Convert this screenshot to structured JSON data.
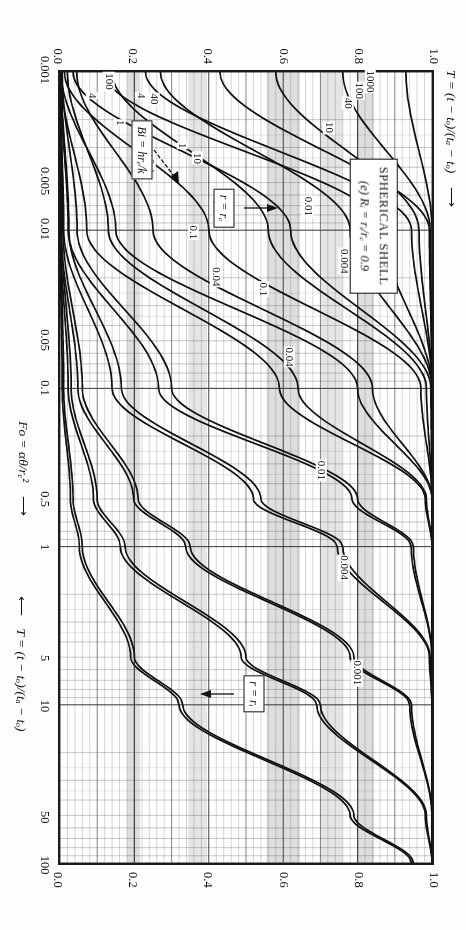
{
  "figure": {
    "title_line1": "SPHERICAL SHELL",
    "title_line2_prefix": "(e) ",
    "title_line2": "Rᵢ = rᵢ/rₑ = 0.9",
    "panel_letter": "(e)"
  },
  "axes": {
    "x_label_plain": "Fo = αθ/rₑ²",
    "x_label_arrow": "⟶",
    "y_label_plain": "T = (t − tₒ)/(tₐ − tₒ)",
    "y_label_arrow_top": "⟶",
    "y_label_arrow_bottom": "⟵",
    "x_ticks": [
      "0.001",
      "0.005",
      "0.01",
      "0.05",
      "0.1",
      "0.5",
      "1",
      "5",
      "10",
      "50",
      "100"
    ],
    "x_tick_values": [
      0.001,
      0.005,
      0.01,
      0.05,
      0.1,
      0.5,
      1,
      5,
      10,
      50,
      100
    ],
    "y_ticks": [
      "0.0",
      "0.2",
      "0.4",
      "0.6",
      "0.8",
      "1.0"
    ],
    "y_tick_values": [
      0.0,
      0.2,
      0.4,
      0.6,
      0.8,
      1.0
    ],
    "x_min": 0.001,
    "x_max": 100,
    "y_min": 0.0,
    "y_max": 1.0,
    "x_scale": "log",
    "y_scale": "linear"
  },
  "annotations": {
    "surface_box": "r = rₑ",
    "inner_box": "r = rᵢ",
    "bi_box": "Bi = hrₑ/k"
  },
  "chart_data": {
    "type": "line",
    "title": "SPHERICAL SHELL  (e) Rᵢ = rᵢ/rₑ = 0.9",
    "xlabel": "Fo = αθ/rₑ²",
    "ylabel": "T = (t − tₒ)/(tₐ − tₒ)",
    "xlim": [
      0.001,
      100
    ],
    "ylim": [
      0.0,
      1.0
    ],
    "xscale": "log",
    "yscale": "linear",
    "grid": true,
    "legend": "none",
    "legend_position": "none",
    "series_groups": [
      {
        "group": "r = rₑ",
        "note": "outer-surface temperature curves; T rises from 0 with Fo",
        "bi_labels": [
          "0.001",
          "0.004",
          "0.01",
          "0.04",
          "0.1",
          "0.4",
          "1",
          "4",
          "10",
          "40",
          "100",
          "1000"
        ],
        "series": [
          {
            "name": "0.001",
            "bi": 0.001,
            "x": [
              0.001,
              0.01,
              0.1,
              0.5,
              1,
              5,
              10,
              50,
              100
            ],
            "y": [
              0.0,
              0.002,
              0.01,
              0.035,
              0.06,
              0.2,
              0.33,
              0.79,
              0.95
            ]
          },
          {
            "name": "0.004",
            "bi": 0.004,
            "x": [
              0.001,
              0.01,
              0.1,
              0.5,
              1,
              5,
              10,
              50,
              100
            ],
            "y": [
              0.0,
              0.004,
              0.03,
              0.1,
              0.175,
              0.5,
              0.7,
              0.985,
              1.0
            ]
          },
          {
            "name": "0.01",
            "bi": 0.01,
            "x": [
              0.001,
              0.01,
              0.1,
              0.5,
              1,
              5,
              10,
              50,
              100
            ],
            "y": [
              0.001,
              0.008,
              0.06,
              0.21,
              0.35,
              0.79,
              0.945,
              1.0,
              1.0
            ]
          },
          {
            "name": "0.04",
            "bi": 0.04,
            "x": [
              0.001,
              0.01,
              0.1,
              0.5,
              1,
              5,
              10,
              50,
              100
            ],
            "y": [
              0.003,
              0.024,
              0.165,
              0.54,
              0.76,
              0.995,
              1.0,
              1.0,
              1.0
            ]
          },
          {
            "name": "0.1",
            "bi": 0.1,
            "x": [
              0.001,
              0.01,
              0.1,
              0.5,
              1,
              5,
              10,
              50,
              100
            ],
            "y": [
              0.006,
              0.046,
              0.3,
              0.8,
              0.95,
              1.0,
              1.0,
              1.0,
              1.0
            ]
          },
          {
            "name": "0.4",
            "bi": 0.4,
            "x": [
              0.001,
              0.01,
              0.1,
              0.5,
              1,
              5,
              10,
              50,
              100
            ],
            "y": [
              0.02,
              0.13,
              0.64,
              0.985,
              1.0,
              1.0,
              1.0,
              1.0,
              1.0
            ]
          },
          {
            "name": "1",
            "bi": 1,
            "x": [
              0.001,
              0.01,
              0.1,
              0.5,
              1,
              5,
              10,
              50,
              100
            ],
            "y": [
              0.045,
              0.25,
              0.84,
              1.0,
              1.0,
              1.0,
              1.0,
              1.0,
              1.0
            ]
          },
          {
            "name": "4",
            "bi": 4,
            "x": [
              0.001,
              0.01,
              0.1,
              0.5,
              1,
              5,
              10,
              50,
              100
            ],
            "y": [
              0.14,
              0.56,
              0.985,
              1.0,
              1.0,
              1.0,
              1.0,
              1.0,
              1.0
            ]
          },
          {
            "name": "10",
            "bi": 10,
            "x": [
              0.001,
              0.01,
              0.1,
              0.5,
              1,
              5,
              10,
              50,
              100
            ],
            "y": [
              0.27,
              0.78,
              1.0,
              1.0,
              1.0,
              1.0,
              1.0,
              1.0,
              1.0
            ]
          },
          {
            "name": "40",
            "bi": 40,
            "x": [
              0.001,
              0.01,
              0.1,
              0.5,
              1,
              5,
              10,
              50,
              100
            ],
            "y": [
              0.58,
              0.965,
              1.0,
              1.0,
              1.0,
              1.0,
              1.0,
              1.0,
              1.0
            ]
          },
          {
            "name": "100",
            "bi": 100,
            "x": [
              0.001,
              0.01,
              0.1,
              0.5,
              1,
              5,
              10,
              50,
              100
            ],
            "y": [
              0.76,
              0.995,
              1.0,
              1.0,
              1.0,
              1.0,
              1.0,
              1.0,
              1.0
            ]
          },
          {
            "name": "1000",
            "bi": 1000,
            "x": [
              0.001,
              0.01,
              0.1,
              0.5,
              1,
              5,
              10,
              50,
              100
            ],
            "y": [
              0.93,
              1.0,
              1.0,
              1.0,
              1.0,
              1.0,
              1.0,
              1.0,
              1.0
            ]
          }
        ]
      },
      {
        "group": "r = rᵢ",
        "note": "inner-surface temperature curves; lag behind the outer surface",
        "bi_labels": [
          "0.001",
          "0.004",
          "0.01",
          "0.04",
          "0.1",
          "0.4",
          "1",
          "4",
          "10",
          "40",
          "100",
          "1000"
        ],
        "series": [
          {
            "name": "0.001",
            "bi": 0.001,
            "x": [
              0.001,
              0.01,
              0.1,
              0.5,
              1,
              5,
              10,
              50,
              100
            ],
            "y": [
              0.0,
              0.0,
              0.006,
              0.028,
              0.052,
              0.19,
              0.32,
              0.78,
              0.945
            ]
          },
          {
            "name": "0.004",
            "bi": 0.004,
            "x": [
              0.001,
              0.01,
              0.1,
              0.5,
              1,
              5,
              10,
              50,
              100
            ],
            "y": [
              0.0,
              0.001,
              0.022,
              0.09,
              0.162,
              0.487,
              0.69,
              0.982,
              1.0
            ]
          },
          {
            "name": "0.01",
            "bi": 0.01,
            "x": [
              0.001,
              0.01,
              0.1,
              0.5,
              1,
              5,
              10,
              50,
              100
            ],
            "y": [
              0.0,
              0.003,
              0.048,
              0.198,
              0.338,
              0.78,
              0.94,
              1.0,
              1.0
            ]
          },
          {
            "name": "0.04",
            "bi": 0.04,
            "x": [
              0.001,
              0.01,
              0.1,
              0.5,
              1,
              5,
              10,
              50,
              100
            ],
            "y": [
              0.0,
              0.01,
              0.14,
              0.52,
              0.745,
              0.993,
              1.0,
              1.0,
              1.0
            ]
          },
          {
            "name": "0.1",
            "bi": 0.1,
            "x": [
              0.001,
              0.01,
              0.1,
              0.5,
              1,
              5,
              10,
              50,
              100
            ],
            "y": [
              0.0,
              0.022,
              0.265,
              0.785,
              0.944,
              1.0,
              1.0,
              1.0,
              1.0
            ]
          },
          {
            "name": "0.4",
            "bi": 0.4,
            "x": [
              0.001,
              0.01,
              0.1,
              0.5,
              1,
              5,
              10,
              50,
              100
            ],
            "y": [
              0.001,
              0.072,
              0.59,
              0.982,
              1.0,
              1.0,
              1.0,
              1.0,
              1.0
            ]
          },
          {
            "name": "1",
            "bi": 1,
            "x": [
              0.001,
              0.01,
              0.1,
              0.5,
              1,
              5,
              10,
              50,
              100
            ],
            "y": [
              0.003,
              0.15,
              0.8,
              1.0,
              1.0,
              1.0,
              1.0,
              1.0,
              1.0
            ]
          },
          {
            "name": "4",
            "bi": 4,
            "x": [
              0.001,
              0.01,
              0.1,
              0.5,
              1,
              5,
              10,
              50,
              100
            ],
            "y": [
              0.012,
              0.4,
              0.97,
              1.0,
              1.0,
              1.0,
              1.0,
              1.0,
              1.0
            ]
          },
          {
            "name": "10",
            "bi": 10,
            "x": [
              0.001,
              0.01,
              0.1,
              0.5,
              1,
              5,
              10,
              50,
              100
            ],
            "y": [
              0.035,
              0.62,
              0.997,
              1.0,
              1.0,
              1.0,
              1.0,
              1.0,
              1.0
            ]
          },
          {
            "name": "40",
            "bi": 40,
            "x": [
              0.001,
              0.01,
              0.1,
              0.5,
              1,
              5,
              10,
              50,
              100
            ],
            "y": [
              0.12,
              0.87,
              1.0,
              1.0,
              1.0,
              1.0,
              1.0,
              1.0,
              1.0
            ]
          },
          {
            "name": "100",
            "bi": 100,
            "x": [
              0.001,
              0.01,
              0.1,
              0.5,
              1,
              5,
              10,
              50,
              100
            ],
            "y": [
              0.23,
              0.945,
              1.0,
              1.0,
              1.0,
              1.0,
              1.0,
              1.0,
              1.0
            ]
          },
          {
            "name": "1000",
            "bi": 1000,
            "x": [
              0.001,
              0.01,
              0.1,
              0.5,
              1,
              5,
              10,
              50,
              100
            ],
            "y": [
              0.43,
              0.993,
              1.0,
              1.0,
              1.0,
              1.0,
              1.0,
              1.0,
              1.0
            ]
          }
        ]
      }
    ],
    "curve_labels": [
      {
        "text": "0.001",
        "x": 0.0145,
        "y": 0.845,
        "group": "r = rₑ"
      },
      {
        "text": "0.004",
        "x": 0.016,
        "y": 0.76,
        "group": "r = rₑ"
      },
      {
        "text": "0.01",
        "x": 0.0072,
        "y": 0.665,
        "group": "r = rₑ"
      },
      {
        "text": "0.04",
        "x": 0.02,
        "y": 0.42,
        "group": "r = rₑ"
      },
      {
        "text": "0.1",
        "x": 0.0105,
        "y": 0.36,
        "group": "r = rₑ"
      },
      {
        "text": "0.4",
        "x": 0.004,
        "y": 0.245,
        "group": "r = rₑ"
      },
      {
        "text": "1",
        "x": 0.00215,
        "y": 0.165,
        "group": "r = rₑ"
      },
      {
        "text": "4",
        "x": 0.00145,
        "y": 0.09,
        "group": "r = rₑ"
      },
      {
        "text": "0.001",
        "x": 6.2,
        "y": 0.795,
        "group": "r = rᵢ"
      },
      {
        "text": "0.004",
        "x": 1.35,
        "y": 0.76,
        "group": "r = rᵢ"
      },
      {
        "text": "0.01",
        "x": 0.33,
        "y": 0.7,
        "group": "r = rᵢ"
      },
      {
        "text": "0.04",
        "x": 0.064,
        "y": 0.615,
        "group": "r = rᵢ"
      },
      {
        "text": "0.1",
        "x": 0.024,
        "y": 0.545,
        "group": "r = rᵢ"
      },
      {
        "text": "0.4",
        "x": 0.0072,
        "y": 0.42,
        "group": "r = rᵢ"
      },
      {
        "text": "1",
        "x": 0.003,
        "y": 0.33,
        "group": "r = rᵢ"
      },
      {
        "text": "4",
        "x": 0.00145,
        "y": 0.22,
        "group": "r = rᵢ"
      },
      {
        "text": "10",
        "x": 0.0023,
        "y": 0.72,
        "group": "r = rᵢ"
      },
      {
        "text": "40",
        "x": 0.00162,
        "y": 0.77,
        "group": "r = rᵢ"
      },
      {
        "text": "100",
        "x": 0.00135,
        "y": 0.8,
        "group": "r = rᵢ"
      },
      {
        "text": "1000",
        "x": 0.00118,
        "y": 0.83,
        "group": "r = rᵢ"
      },
      {
        "text": "10",
        "x": 0.0036,
        "y": 0.37,
        "group": "r = rᵢ"
      },
      {
        "text": "40",
        "x": 0.00152,
        "y": 0.255,
        "group": "r = rᵢ"
      },
      {
        "text": "100",
        "x": 0.00118,
        "y": 0.135,
        "group": "r = rᵢ"
      }
    ],
    "shaded_bands_y": [
      [
        0.555,
        0.645
      ],
      [
        0.7,
        0.76
      ],
      [
        0.8,
        0.845
      ],
      [
        0.345,
        0.395
      ],
      [
        0.18,
        0.215
      ]
    ]
  }
}
